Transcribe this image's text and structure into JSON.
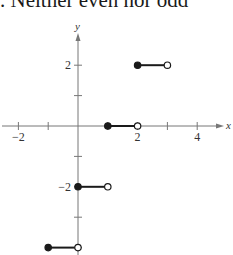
{
  "heading": {
    "text": ". Neither even nor odd"
  },
  "colors": {
    "axis": "#777777",
    "segment": "#1a1a1a",
    "background": "#ffffff"
  },
  "chart_data": {
    "type": "line",
    "title": "",
    "xlabel": "x",
    "ylabel": "y",
    "xlim": [
      -2.6,
      4.8
    ],
    "ylim": [
      -4.1,
      2.9
    ],
    "grid": false,
    "legend": null,
    "x_ticks": [
      -2,
      -1,
      0,
      1,
      2,
      3,
      4
    ],
    "x_tick_labels": [
      {
        "value": -2,
        "label": "−2"
      },
      {
        "value": 2,
        "label": "2"
      },
      {
        "value": 4,
        "label": "4"
      }
    ],
    "y_ticks": [
      -4,
      -3,
      -2,
      -1,
      1,
      2
    ],
    "y_tick_labels": [
      {
        "value": 2,
        "label": "2"
      },
      {
        "value": -2,
        "label": "−2"
      }
    ],
    "series": [
      {
        "name": "step function",
        "segments": [
          {
            "x_start": -1,
            "x_end": 0,
            "y": -4,
            "start_closed": true,
            "end_closed": false
          },
          {
            "x_start": 0,
            "x_end": 1,
            "y": -2,
            "start_closed": true,
            "end_closed": false
          },
          {
            "x_start": 1,
            "x_end": 2,
            "y": 0,
            "start_closed": true,
            "end_closed": false
          },
          {
            "x_start": 2,
            "x_end": 3,
            "y": 2,
            "start_closed": true,
            "end_closed": false
          }
        ]
      }
    ]
  }
}
